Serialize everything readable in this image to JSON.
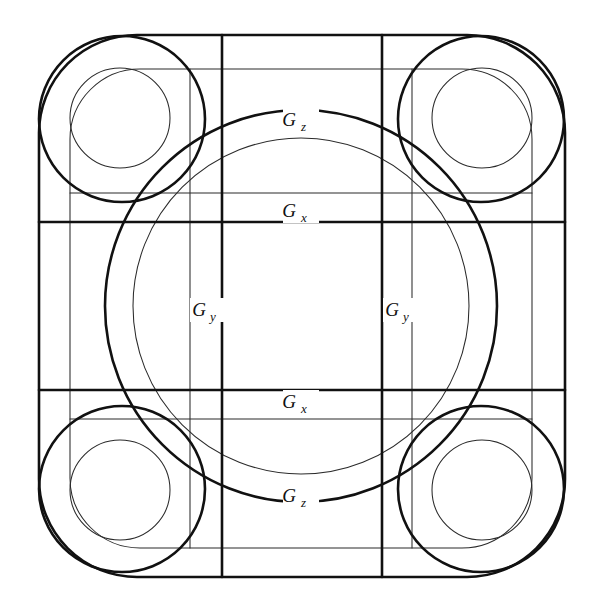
{
  "figure": {
    "background_color": "#ffffff",
    "stroke_color": "#111111",
    "thin_stroke_color": "#2b2b2b",
    "width": 601,
    "height": 607
  },
  "labels": [
    {
      "id": "gz-top",
      "base": "G",
      "sub": "z",
      "text": "Gz",
      "x": 301,
      "y": 124,
      "role": "generator-label"
    },
    {
      "id": "gx-top",
      "base": "G",
      "sub": "x",
      "text": "Gx",
      "x": 301,
      "y": 215,
      "role": "generator-label"
    },
    {
      "id": "gy-left",
      "base": "G",
      "sub": "y",
      "text": "Gy",
      "x": 206,
      "y": 314,
      "role": "generator-label"
    },
    {
      "id": "gy-right",
      "base": "G",
      "sub": "y",
      "text": "Gy",
      "x": 398,
      "y": 314,
      "role": "generator-label"
    },
    {
      "id": "gx-bottom",
      "base": "G",
      "sub": "x",
      "text": "Gx",
      "x": 301,
      "y": 406,
      "role": "generator-label"
    },
    {
      "id": "gz-bottom",
      "base": "G",
      "sub": "z",
      "text": "Gz",
      "x": 301,
      "y": 500,
      "role": "generator-label"
    }
  ],
  "geometry": {
    "center": {
      "x": 301,
      "y": 306
    },
    "outer_rounded_square": {
      "left": 39,
      "top": 35,
      "right": 565,
      "bottom": 577,
      "corner_radius": 98,
      "weight": "thick"
    },
    "inner_rounded_square": {
      "left": 70,
      "top": 69,
      "right": 532,
      "bottom": 548,
      "corner_radius": 70,
      "weight": "thin"
    },
    "central_circle_thick": {
      "cx": 301,
      "cy": 306,
      "r": 196,
      "weight": "thick"
    },
    "central_circle_thin": {
      "cx": 301,
      "cy": 306,
      "r": 168,
      "weight": "thin"
    },
    "corner_circles": [
      {
        "cx": 120,
        "cy": 118,
        "r": 50,
        "weight": "thin",
        "position": "top-left"
      },
      {
        "cx": 482,
        "cy": 118,
        "r": 50,
        "weight": "thin",
        "position": "top-right"
      },
      {
        "cx": 120,
        "cy": 490,
        "r": 50,
        "weight": "thin",
        "position": "bottom-left"
      },
      {
        "cx": 482,
        "cy": 490,
        "r": 50,
        "weight": "thin",
        "position": "bottom-right"
      }
    ],
    "corner_lobes_thick": [
      {
        "cx": 120,
        "cy": 118,
        "rx": 82,
        "ry": 83,
        "position": "top-left"
      },
      {
        "cx": 482,
        "cy": 118,
        "rx": 82,
        "ry": 83,
        "position": "top-right"
      },
      {
        "cx": 120,
        "cy": 490,
        "rx": 82,
        "ry": 83,
        "position": "bottom-left"
      },
      {
        "cx": 482,
        "cy": 490,
        "rx": 82,
        "ry": 83,
        "position": "bottom-right"
      }
    ],
    "horizontal_lines_thick": [
      {
        "y": 222,
        "x1": 39,
        "x2": 565,
        "name": "gx-top-line"
      },
      {
        "y": 390,
        "x1": 39,
        "x2": 565,
        "name": "gx-bottom-line"
      }
    ],
    "horizontal_lines_thin": [
      {
        "y": 69,
        "x1": 70,
        "x2": 532,
        "name": "inner-top"
      },
      {
        "y": 193,
        "x1": 70,
        "x2": 532,
        "name": "gx-top-thin"
      },
      {
        "y": 419,
        "x1": 70,
        "x2": 532,
        "name": "gx-bottom-thin"
      },
      {
        "y": 548,
        "x1": 70,
        "x2": 532,
        "name": "inner-bottom"
      }
    ],
    "vertical_lines_thick": [
      {
        "x": 222,
        "y1": 35,
        "y2": 577,
        "name": "gy-left-line"
      },
      {
        "x": 382,
        "y1": 35,
        "y2": 577,
        "name": "gy-right-line"
      }
    ],
    "vertical_lines_thin": [
      {
        "x": 70,
        "y1": 69,
        "y2": 548,
        "name": "inner-left"
      },
      {
        "x": 190,
        "y1": 69,
        "y2": 548,
        "name": "gy-left-thin"
      },
      {
        "x": 412,
        "y1": 69,
        "y2": 548,
        "name": "gy-right-thin"
      },
      {
        "x": 532,
        "y1": 69,
        "y2": 548,
        "name": "inner-right"
      }
    ]
  }
}
